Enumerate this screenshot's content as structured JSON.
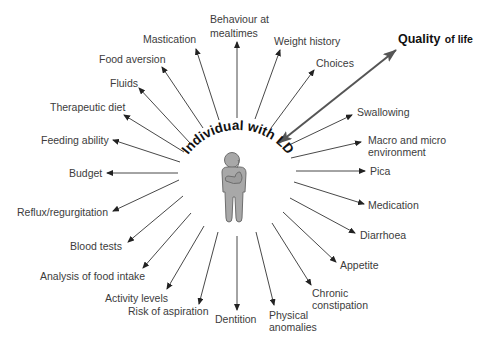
{
  "diagram": {
    "center_label": "Individual with LD",
    "center_icon": "thinking-person-icon",
    "highlight": {
      "label_main": "Quality",
      "label_rest": "of life",
      "arrow": "bidirectional",
      "color": "#555555"
    },
    "factors": [
      {
        "id": "behaviour-at-mealtimes",
        "label": "Behaviour at mealtimes"
      },
      {
        "id": "weight-history",
        "label": "Weight history"
      },
      {
        "id": "choices",
        "label": "Choices"
      },
      {
        "id": "swallowing",
        "label": "Swallowing"
      },
      {
        "id": "macro-micro-environment",
        "label": "Macro and micro environment"
      },
      {
        "id": "pica",
        "label": "Pica"
      },
      {
        "id": "medication",
        "label": "Medication"
      },
      {
        "id": "diarrhoea",
        "label": "Diarrhoea"
      },
      {
        "id": "appetite",
        "label": "Appetite"
      },
      {
        "id": "chronic-constipation",
        "label": "Chronic constipation"
      },
      {
        "id": "physical-anomalies",
        "label": "Physical anomalies"
      },
      {
        "id": "dentition",
        "label": "Dentition"
      },
      {
        "id": "risk-of-aspiration",
        "label": "Risk of aspiration"
      },
      {
        "id": "activity-levels",
        "label": "Activity levels"
      },
      {
        "id": "analysis-of-food-intake",
        "label": "Analysis of food intake"
      },
      {
        "id": "blood-tests",
        "label": "Blood tests"
      },
      {
        "id": "reflux-regurgitation",
        "label": "Reflux/regurgitation"
      },
      {
        "id": "budget",
        "label": "Budget"
      },
      {
        "id": "feeding-ability",
        "label": "Feeding ability"
      },
      {
        "id": "therapeutic-diet",
        "label": "Therapeutic diet"
      },
      {
        "id": "fluids",
        "label": "Fluids"
      },
      {
        "id": "food-aversion",
        "label": "Food aversion"
      },
      {
        "id": "mastication",
        "label": "Mastication"
      }
    ],
    "colors": {
      "arrow": "#333333",
      "figure_fill": "#a8a8a8",
      "figure_stroke": "#6e6e6e",
      "text": "#3c3c3c"
    }
  }
}
